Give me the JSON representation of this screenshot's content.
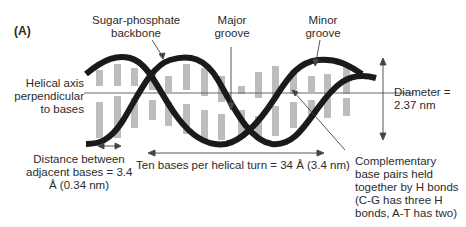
{
  "figure": {
    "panel_label": "(A)",
    "colors": {
      "backbone": "#1a1a1a",
      "base_pair": "#bdbdbd",
      "axis_line": "#555555",
      "text": "#2b2b2b"
    },
    "labels": {
      "backbone": [
        "Sugar-phosphate",
        "backbone"
      ],
      "major_groove": [
        "Major",
        "groove"
      ],
      "minor_groove": [
        "Minor",
        "groove"
      ],
      "helical_axis": [
        "Helical axis",
        "perpendicular",
        "to bases"
      ],
      "diameter": [
        "Diameter =",
        "2.37 nm"
      ],
      "distance_bases": [
        "Distance between",
        "adjacent bases = 3.4",
        "Å (0.34 nm)"
      ],
      "turn": "Ten bases per helical turn = 34 Å (3.4 nm)",
      "complementary": [
        "Complementary",
        "base pairs held",
        "together by H bonds",
        "(C-G has three H",
        "bonds, A-T has two)"
      ]
    }
  }
}
